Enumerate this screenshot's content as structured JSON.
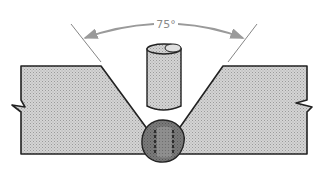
{
  "diagram": {
    "angle_label": "75°",
    "colors": {
      "plate_fill": "#c8c8c8",
      "plate_stroke": "#222222",
      "electrode_fill": "#cfcfcf",
      "weld_outer": "#6e6e6e",
      "weld_inner": "#8a8a8a",
      "arrow": "#9a9a9a",
      "guide_line": "#777777"
    }
  }
}
